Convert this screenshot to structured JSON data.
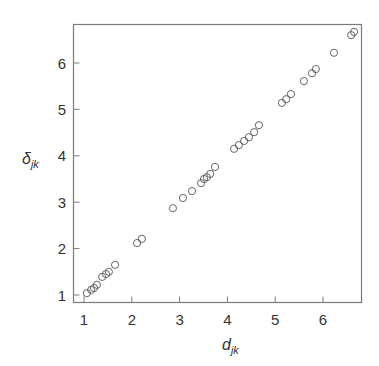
{
  "chart_data": {
    "type": "scatter",
    "title": "",
    "xlabel": "d",
    "xlabel_sub": "jk",
    "ylabel": "δ",
    "ylabel_sub": "jk",
    "xlim": [
      0.8,
      6.8
    ],
    "ylim": [
      0.8,
      6.85
    ],
    "xticks": [
      1,
      2,
      3,
      4,
      5,
      6
    ],
    "yticks": [
      1,
      2,
      3,
      4,
      5,
      6
    ],
    "xtick_labels": [
      "1",
      "2",
      "3",
      "4",
      "5",
      "6"
    ],
    "ytick_labels": [
      "1",
      "2",
      "3",
      "4",
      "5",
      "6"
    ],
    "grid": false,
    "legend": null,
    "marker": "open-circle",
    "series": [
      {
        "name": "points",
        "x": [
          1.06,
          1.15,
          1.21,
          1.27,
          1.38,
          1.46,
          1.52,
          1.65,
          2.11,
          2.21,
          2.86,
          3.07,
          3.26,
          3.45,
          3.51,
          3.57,
          3.64,
          3.74,
          4.14,
          4.24,
          4.35,
          4.45,
          4.56,
          4.66,
          5.14,
          5.23,
          5.33,
          5.6,
          5.77,
          5.85,
          6.23,
          6.59,
          6.65
        ],
        "y": [
          1.04,
          1.11,
          1.15,
          1.22,
          1.39,
          1.45,
          1.5,
          1.65,
          2.12,
          2.21,
          2.87,
          3.09,
          3.24,
          3.41,
          3.5,
          3.54,
          3.61,
          3.76,
          4.15,
          4.23,
          4.32,
          4.4,
          4.51,
          4.66,
          5.14,
          5.22,
          5.33,
          5.61,
          5.78,
          5.87,
          6.22,
          6.6,
          6.67
        ]
      }
    ]
  }
}
